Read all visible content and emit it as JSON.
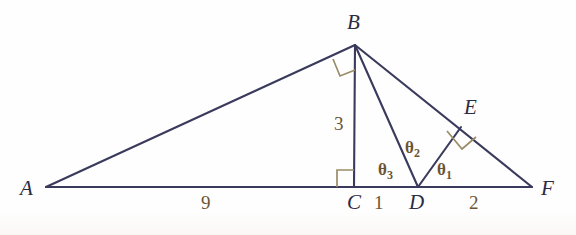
{
  "figure": {
    "kind": "geometry-diagram",
    "background_color": "#fefefe",
    "line_color": "#3a3a5c",
    "right_angle_color": "#9a8c66",
    "vertex_label_color": "#2b2b44",
    "measure_label_color": "#6b5434",
    "vertices": [
      {
        "id": "A",
        "label": "A",
        "x": 46,
        "y": 188
      },
      {
        "id": "B",
        "label": "B",
        "x": 355,
        "y": 44
      },
      {
        "id": "C",
        "label": "C",
        "x": 354,
        "y": 186
      },
      {
        "id": "D",
        "label": "D",
        "x": 418,
        "y": 186
      },
      {
        "id": "E",
        "label": "E",
        "x": 461,
        "y": 127
      },
      {
        "id": "F",
        "label": "F",
        "x": 532,
        "y": 186
      }
    ],
    "vertex_label_positions": [
      {
        "id": "A",
        "label": "A",
        "x": 20,
        "y": 178
      },
      {
        "id": "B",
        "label": "B",
        "x": 347,
        "y": 12
      },
      {
        "id": "C",
        "label": "C",
        "x": 347,
        "y": 192
      },
      {
        "id": "D",
        "label": "D",
        "x": 409,
        "y": 192
      },
      {
        "id": "E",
        "label": "E",
        "x": 464,
        "y": 97
      },
      {
        "id": "F",
        "label": "F",
        "x": 541,
        "y": 178
      }
    ],
    "segments": [
      {
        "name": "A-F-baseline",
        "from": "A",
        "to": "F"
      },
      {
        "name": "A-B",
        "from": "A",
        "to": "B"
      },
      {
        "name": "B-C-altitude",
        "from": "B",
        "to": "C"
      },
      {
        "name": "B-D",
        "from": "B",
        "to": "D"
      },
      {
        "name": "B-F",
        "from": "B",
        "to": "F"
      },
      {
        "name": "D-E",
        "from": "D",
        "to": "E"
      }
    ],
    "right_angles": [
      {
        "name": "right-angle-at-B",
        "vertex": "B",
        "between": [
          "A",
          "C"
        ]
      },
      {
        "name": "right-angle-at-C",
        "vertex": "C",
        "between": [
          "A",
          "B"
        ]
      },
      {
        "name": "right-angle-at-E",
        "vertex": "E",
        "between": [
          "D",
          "F"
        ]
      }
    ],
    "length_labels": [
      {
        "name": "length-AC",
        "text": "9",
        "x": 201,
        "y": 193,
        "segment": "A-C"
      },
      {
        "name": "length-BC",
        "text": "3",
        "x": 334,
        "y": 114,
        "segment": "B-C"
      },
      {
        "name": "length-CD",
        "text": "1",
        "x": 374,
        "y": 193,
        "segment": "C-D"
      },
      {
        "name": "length-DF",
        "text": "2",
        "x": 469,
        "y": 193,
        "segment": "D-F"
      }
    ],
    "angle_labels": [
      {
        "name": "angle-theta-3",
        "symbol": "θ",
        "subscript": "3",
        "x": 378,
        "y": 161,
        "at": "D",
        "between": [
          "C",
          "B"
        ]
      },
      {
        "name": "angle-theta-2",
        "symbol": "θ",
        "subscript": "2",
        "x": 405,
        "y": 139,
        "at": "D",
        "between": [
          "B",
          "E"
        ]
      },
      {
        "name": "angle-theta-1",
        "symbol": "θ",
        "subscript": "1",
        "x": 437,
        "y": 161,
        "at": "D",
        "between": [
          "E",
          "F"
        ]
      }
    ]
  }
}
